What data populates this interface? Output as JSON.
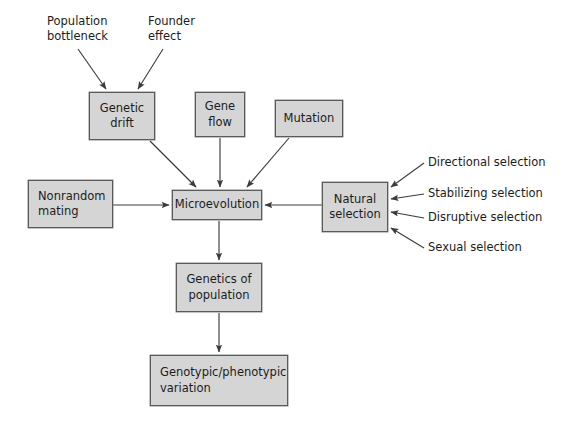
{
  "diagram": {
    "canvas": {
      "width": 564,
      "height": 430
    },
    "colors": {
      "background": "#ffffff",
      "box_fill": "#d5d5d5",
      "box_border": "#5a5a5a",
      "text": "#1c1c1c",
      "arrow": "#3b3b3b"
    },
    "nodes": [
      {
        "id": "genetic_drift",
        "label": "Genetic\ndrift",
        "x": 89,
        "y": 92,
        "w": 66,
        "h": 48
      },
      {
        "id": "gene_flow",
        "label": "Gene\nflow",
        "x": 195,
        "y": 92,
        "w": 50,
        "h": 45
      },
      {
        "id": "mutation",
        "label": "Mutation",
        "x": 275,
        "y": 100,
        "w": 68,
        "h": 37
      },
      {
        "id": "nonrandom",
        "label": "Nonrandom\nmating",
        "x": 28,
        "y": 180,
        "w": 85,
        "h": 48
      },
      {
        "id": "microevolution",
        "label": "Microevolution",
        "x": 172,
        "y": 190,
        "w": 90,
        "h": 30
      },
      {
        "id": "natural",
        "label": "Natural\nselection",
        "x": 322,
        "y": 182,
        "w": 66,
        "h": 50
      },
      {
        "id": "genetics_pop",
        "label": "Genetics of\npopulation",
        "x": 176,
        "y": 263,
        "w": 86,
        "h": 49
      },
      {
        "id": "variation",
        "label": "Genotypic/phenotypic\nvariation",
        "x": 150,
        "y": 355,
        "w": 138,
        "h": 51
      }
    ],
    "labels": [
      {
        "id": "population_bottleneck",
        "text": "Population\nbottleneck",
        "x": 47,
        "y": 14
      },
      {
        "id": "founder_effect",
        "text": "Founder\neffect",
        "x": 148,
        "y": 14
      },
      {
        "id": "directional_selection",
        "text": "Directional selection",
        "x": 428,
        "y": 155
      },
      {
        "id": "stabilizing_selection",
        "text": "Stabilizing selection",
        "x": 428,
        "y": 186
      },
      {
        "id": "disruptive_selection",
        "text": "Disruptive selection",
        "x": 428,
        "y": 210
      },
      {
        "id": "sexual_selection",
        "text": "Sexual selection",
        "x": 428,
        "y": 240
      }
    ],
    "edges": [
      {
        "id": "bottleneck-to-drift",
        "from": "population_bottleneck",
        "to": "genetic_drift",
        "kind": "arrow-diagonal"
      },
      {
        "id": "founder-to-drift",
        "from": "founder_effect",
        "to": "genetic_drift",
        "kind": "arrow-diagonal"
      },
      {
        "id": "drift-to-micro",
        "from": "genetic_drift",
        "to": "microevolution",
        "kind": "arrow-diagonal"
      },
      {
        "id": "geneflow-to-micro",
        "from": "gene_flow",
        "to": "microevolution",
        "kind": "arrow-vertical"
      },
      {
        "id": "mutation-to-micro",
        "from": "mutation",
        "to": "microevolution",
        "kind": "arrow-diagonal"
      },
      {
        "id": "nonrandom-to-micro",
        "from": "nonrandom",
        "to": "microevolution",
        "kind": "arrow-horizontal"
      },
      {
        "id": "natural-to-micro",
        "from": "natural",
        "to": "microevolution",
        "kind": "arrow-horizontal"
      },
      {
        "id": "directional-to-natural",
        "from": "directional_selection",
        "to": "natural",
        "kind": "arrow-diagonal"
      },
      {
        "id": "stabilizing-to-natural",
        "from": "stabilizing_selection",
        "to": "natural",
        "kind": "arrow-horizontal"
      },
      {
        "id": "disruptive-to-natural",
        "from": "disruptive_selection",
        "to": "natural",
        "kind": "arrow-horizontal"
      },
      {
        "id": "sexual-to-natural",
        "from": "sexual_selection",
        "to": "natural",
        "kind": "arrow-diagonal"
      },
      {
        "id": "micro-to-genetics",
        "from": "microevolution",
        "to": "genetics_pop",
        "kind": "arrow-vertical"
      },
      {
        "id": "genetics-to-variation",
        "from": "genetics_pop",
        "to": "variation",
        "kind": "arrow-vertical"
      }
    ]
  }
}
